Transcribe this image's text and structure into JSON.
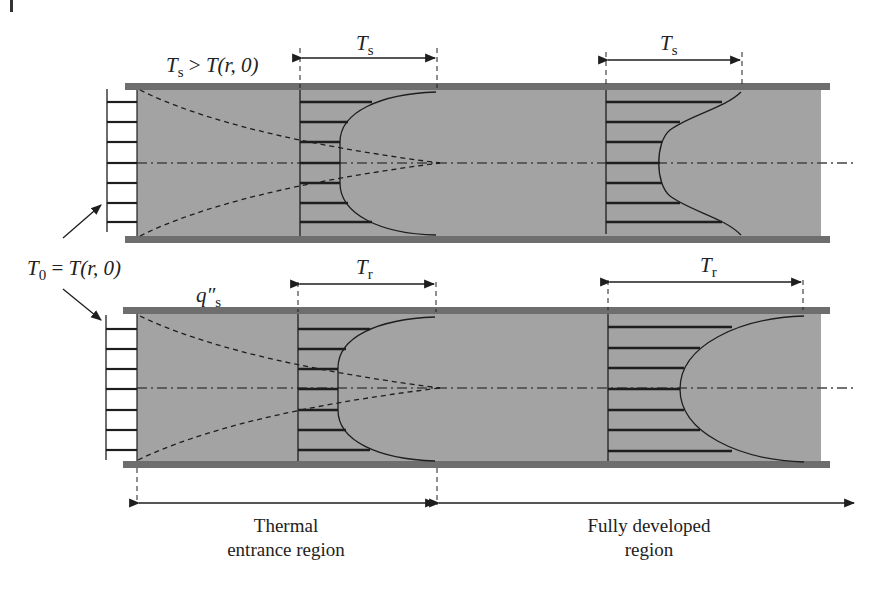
{
  "figure": {
    "type": "thermal entrance region diagram in circular tube",
    "colors": {
      "fluid": "#a3a3a3",
      "wall": "#6e6e6e",
      "lines": "#1e1e1e",
      "background": "#ffffff"
    }
  },
  "labels": {
    "top_condition": {
      "main": "T",
      "sub": "s",
      "rel": " > ",
      "rhs": "T(r, 0)"
    },
    "top_profile1": {
      "main": "T",
      "sub": "s"
    },
    "top_profile2": {
      "main": "T",
      "sub": "s"
    },
    "inlet": {
      "main": "T",
      "sub": "0",
      "rel": " = ",
      "rhs": "T(r, 0)"
    },
    "bottom_condition": {
      "main": "q″",
      "sub": "s"
    },
    "bottom_profile1": {
      "main": "T",
      "sub": "r"
    },
    "bottom_profile2": {
      "main": "T",
      "sub": "r"
    },
    "region_entrance": {
      "line1": "Thermal",
      "line2": "entrance region"
    },
    "region_developed": {
      "line1": "Fully developed",
      "line2": "region"
    }
  },
  "panels": [
    {
      "name": "constant-surface-temperature",
      "boundary": "Ts > T(r, 0)"
    },
    {
      "name": "constant-surface-heat-flux",
      "boundary": "q″s"
    }
  ]
}
